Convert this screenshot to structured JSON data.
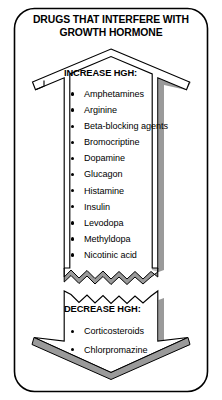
{
  "figure": {
    "title": "DRUGS THAT INTERFERE WITH GROWTH HORMONE",
    "title_line_1": "DRUGS THAT INTERFERE WITH",
    "title_line_2": "GROWTH HORMONE"
  },
  "sections": {
    "increase": {
      "heading": "INCREASE HGH:",
      "items": [
        "Amphetamines",
        "Arginine",
        "Beta-blocking agents",
        "Bromocriptine",
        "Dopamine",
        "Glucagon",
        "Histamine",
        "Insulin",
        "Levodopa",
        "Methyldopa",
        "Nicotinic acid"
      ]
    },
    "decrease": {
      "heading": "DECREASE HGH:",
      "items": [
        "Corticosteroids",
        "Chlorpromazine"
      ]
    }
  },
  "colors": {
    "background": "#ffffff",
    "ink": "#000000",
    "shadow_gray": "#9a9a9a",
    "frame": "#000000"
  }
}
